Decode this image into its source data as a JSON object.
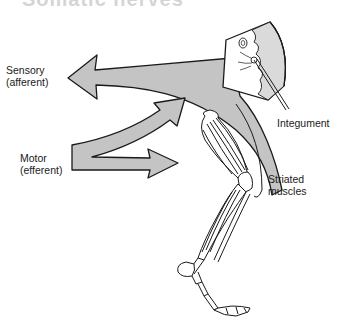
{
  "figure": {
    "title": "Somatic nerves",
    "colors": {
      "arrow_fill": "#c4c4c4",
      "arrow_stroke": "#1a1a1a",
      "line": "#1a1a1a",
      "skin_stipple": "#d8d8d8",
      "background": "#ffffff"
    }
  },
  "labels": {
    "sensory": {
      "line1": "Sensory",
      "line2": "(afferent)"
    },
    "motor": {
      "line1": "Motor",
      "line2": "(efferent)"
    },
    "integument": {
      "line1": "Integument"
    },
    "striated": {
      "line1": "Striated",
      "line2": "muscles"
    }
  },
  "icons": {
    "sensory_arrow": "arrow-left",
    "motor_arrows": "arrow-right-forked",
    "skin_patch": "skin-section",
    "leg": "leg-skeleton-muscles"
  }
}
